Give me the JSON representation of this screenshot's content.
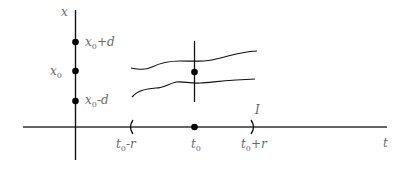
{
  "diagram": {
    "axes": {
      "vertical_label": "x",
      "horizontal_label": "t"
    },
    "y_points": [
      {
        "base": "x",
        "sub": "0",
        "suffix": "+d"
      },
      {
        "base": "x",
        "sub": "0",
        "suffix": ""
      },
      {
        "base": "x",
        "sub": "0",
        "suffix": "-d"
      }
    ],
    "t_points": [
      {
        "base": "t",
        "sub": "0",
        "suffix": "-r"
      },
      {
        "base": "t",
        "sub": "0",
        "suffix": ""
      },
      {
        "base": "t",
        "sub": "0",
        "suffix": "+r"
      }
    ],
    "interval_label": "I",
    "colors": {
      "line": "#1a1a1a",
      "label": "#6a6a6a"
    }
  }
}
